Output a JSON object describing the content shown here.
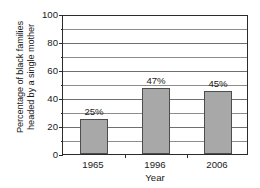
{
  "chart_data": {
    "type": "bar",
    "title": "",
    "subtitle": "",
    "categories": [
      "1965",
      "1996",
      "2006"
    ],
    "values": [
      25,
      47,
      45
    ],
    "data_labels": [
      "25%",
      "47%",
      "45%"
    ],
    "series": [
      {
        "name": "Percentage of black families headed by a single mother",
        "values": [
          25,
          47,
          45
        ]
      }
    ],
    "xlabel": "Year",
    "ylabel": "Percentage of black families headed by a single mother",
    "ylabel_line1": "Percentage of black families",
    "ylabel_line2": "headed by a single mother",
    "ylim": [
      0,
      100
    ],
    "y_major_ticks": [
      0,
      20,
      40,
      60,
      80,
      100
    ],
    "y_tick_labels": [
      "0",
      "20",
      "40",
      "60",
      "80",
      "100"
    ],
    "y_minor_ticks": [
      10,
      30,
      50,
      70,
      90
    ],
    "y_gridlines": [
      0,
      10,
      20,
      30,
      40,
      50,
      60,
      70,
      80,
      90,
      100
    ],
    "grid": true,
    "legend": false,
    "legend_position": "none",
    "bar_color": "#a8a8a8",
    "bar_border_color": "#4d4d4d",
    "axis_color": "#2b2b2b",
    "gridline_color": "#8d8d8d",
    "background_color": "#ffffff",
    "plot_background_color": "#ffffff"
  }
}
